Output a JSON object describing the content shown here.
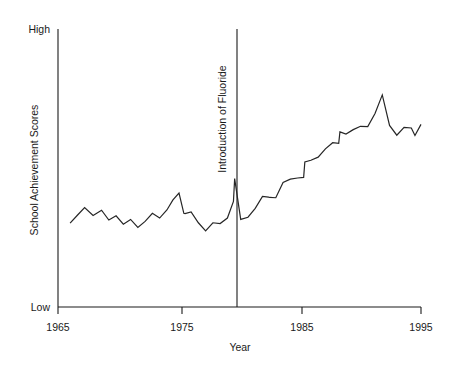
{
  "chart_data": {
    "type": "line",
    "title": "",
    "xlabel": "Year",
    "ylabel": "School Achievement Scores",
    "xlim": [
      1965,
      1995
    ],
    "ylim": [
      0,
      100
    ],
    "ytick_labels": [
      "High",
      "Low"
    ],
    "ytick_values": [
      100,
      0
    ],
    "xtick_labels": [
      "1965",
      "1975",
      "1985",
      "1995"
    ],
    "xtick_values": [
      1965,
      1975,
      1985,
      1995
    ],
    "grid": false,
    "legend": "none",
    "annotations": [
      {
        "text": "Introduction of Fluoride",
        "type": "vertical-line-label",
        "x": 1979.8,
        "orientation": "vertical-bottom-to-top"
      }
    ],
    "series": [
      {
        "name": "School Achievement Scores",
        "x": [
          1966.0,
          1966.6,
          1967.2,
          1967.9,
          1968.6,
          1969.2,
          1969.8,
          1970.4,
          1971.0,
          1971.6,
          1972.2,
          1972.8,
          1973.4,
          1974.0,
          1974.5,
          1975.0,
          1975.4,
          1975.5,
          1976.0,
          1976.6,
          1977.2,
          1977.8,
          1978.4,
          1979.0,
          1979.5,
          1979.6,
          1980.1,
          1980.7,
          1981.3,
          1981.9,
          1982.4,
          1982.5,
          1983.0,
          1983.6,
          1984.2,
          1984.8,
          1985.3,
          1985.4,
          1985.9,
          1986.5,
          1987.1,
          1987.7,
          1988.2,
          1988.3,
          1988.8,
          1989.4,
          1990.0,
          1990.6,
          1991.2,
          1991.8,
          1992.4,
          1993.0,
          1993.6,
          1994.2,
          1994.5,
          1995.0
        ],
        "y": [
          30.2,
          33.0,
          35.8,
          32.9,
          34.8,
          31.3,
          32.8,
          29.8,
          31.5,
          28.6,
          30.8,
          33.7,
          32.0,
          34.9,
          38.5,
          41.0,
          33.7,
          33.6,
          34.2,
          30.3,
          27.4,
          30.3,
          30.0,
          32.0,
          38.0,
          46.2,
          31.5,
          32.3,
          35.5,
          39.8,
          39.5,
          39.4,
          39.3,
          44.8,
          46.0,
          46.4,
          46.6,
          52.2,
          52.8,
          53.9,
          56.9,
          59.1,
          58.9,
          63.0,
          62.2,
          63.8,
          65.0,
          64.9,
          69.6,
          76.3,
          65.3,
          61.8,
          64.6,
          64.4,
          61.7,
          65.7
        ]
      }
    ]
  },
  "axes": {
    "y_high_label": "High",
    "y_low_label": "Low",
    "y_title": "School Achievement Scores",
    "x_title": "Year",
    "x_ticks": [
      "1965",
      "1975",
      "1985",
      "1995"
    ]
  },
  "annotation": {
    "fluoride_label": "Introduction of Fluoride"
  }
}
